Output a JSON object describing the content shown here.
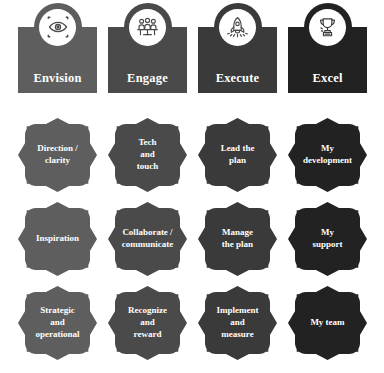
{
  "diagram": {
    "columns": [
      {
        "key": "envision",
        "header": "Envision",
        "icon": "eye-target-icon",
        "color": "#5e5e5e",
        "x": 18,
        "badges": [
          "Direction /\nclarity",
          "Inspiration",
          "Strategic\nand\noperational"
        ]
      },
      {
        "key": "engage",
        "header": "Engage",
        "icon": "meeting-people-icon",
        "color": "#4a4a4a",
        "x": 108,
        "badges": [
          "Tech\nand\ntouch",
          "Collaborate /\ncommunicate",
          "Recognize\nand\nreward"
        ]
      },
      {
        "key": "execute",
        "header": "Execute",
        "icon": "rocket-icon",
        "color": "#3a3a3a",
        "x": 198,
        "badges": [
          "Lead the\nplan",
          "Manage\nthe plan",
          "Implement\nand\nmeasure"
        ]
      },
      {
        "key": "excel",
        "header": "Excel",
        "icon": "trophy-icon",
        "color": "#222222",
        "x": 288,
        "badges": [
          "My\ndevelopment",
          "My\nsupport",
          "My team"
        ]
      }
    ],
    "rows_y": [
      10,
      94,
      178
    ],
    "palette": {
      "background": "#ffffff",
      "text": "#ffffff",
      "icon_face": "#ffffff"
    }
  }
}
